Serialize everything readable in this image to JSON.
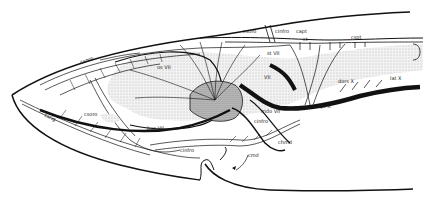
{
  "figure": {
    "type": "anatomical-diagram",
    "colors": {
      "ink": "#111111",
      "stipple": "#cfcfcf",
      "brain": "#e6e6e6",
      "background": "#ffffff"
    }
  },
  "labels": {
    "csoro_top": "csoro",
    "cinfro_top": "cinfro",
    "capt": "capt",
    "ct": "ct",
    "cspt": "cspt",
    "os_vii": "os VII",
    "st_vii": "st VII",
    "vii": "VII",
    "dors_x": "dors X",
    "lat_x": "lat X",
    "spt_x": "spt X",
    "spt_ix": "spt IX",
    "mdo_vii": "mdo VII",
    "csoro_low": "csoro",
    "cinfro_mid": "cinfro",
    "cinfro_low": "cinfro",
    "bucc_vii": "buc VII",
    "csrig": "csrig",
    "chmd": "chmd",
    "cmd": "cmd"
  },
  "caption": {
    "visible": "faint illegible caption text below figure"
  }
}
